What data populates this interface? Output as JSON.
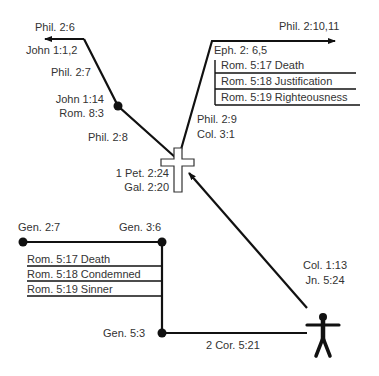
{
  "diagram": {
    "colors": {
      "line": "#111111",
      "text": "#333333",
      "background": "#ffffff"
    },
    "top_left_path": {
      "labels": {
        "phil_2_6": "Phil. 2:6",
        "john_1_1_2": "John 1:1,2",
        "phil_2_7": "Phil. 2:7",
        "john_1_14": "John 1:14",
        "rom_8_3": "Rom. 8:3",
        "phil_2_8": "Phil. 2:8"
      }
    },
    "cross": {
      "labels": {
        "pet_2_24": "1 Pet. 2:24",
        "gal_2_20": "Gal. 2:20"
      }
    },
    "ascension_path": {
      "labels": {
        "phil_2_9": "Phil. 2:9",
        "col_3_1": "Col. 3:1",
        "phil_2_10_11": "Phil. 2:10,11",
        "eph_2_6_5": "Eph. 2: 6,5"
      },
      "rom_table": [
        "Rom. 5:17 Death",
        "Rom. 5:18 Justification",
        "Rom. 5:19 Righteousness"
      ]
    },
    "adam_path": {
      "labels": {
        "gen_2_7": "Gen. 2:7",
        "gen_3_6": "Gen. 3:6",
        "gen_5_3": "Gen. 5:3",
        "cor_5_21": "2 Cor. 5:21"
      },
      "rom_table": [
        "Rom. 5:17 Death",
        "Rom. 5:18 Condemned",
        "Rom. 5:19 Sinner"
      ]
    },
    "person": {
      "labels": {
        "col_1_13": "Col. 1:13",
        "jn_5_24": "Jn. 5:24"
      }
    }
  }
}
